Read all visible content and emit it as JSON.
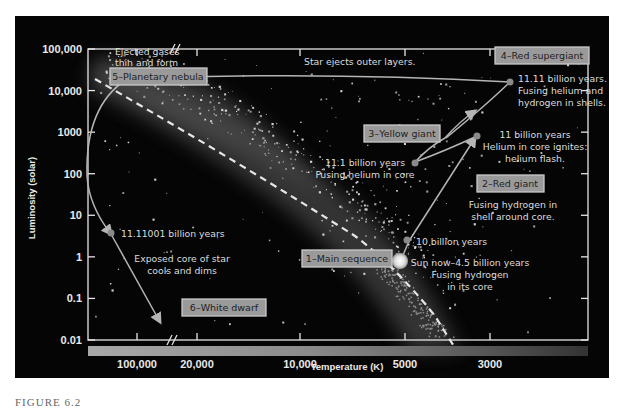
{
  "figure": {
    "caption": "FIGURE 6.2",
    "background_color": "#050505",
    "stage_box_color": "#9a9a9a",
    "track_color": "#b5b5b5"
  },
  "chart_data": {
    "type": "scatter",
    "title": "",
    "xlabel": "Temperature (K)",
    "ylabel": "Luminosity (solar)",
    "x_scale": "log, reversed (hot on left), axis break between 100,000 and 20,000",
    "y_scale": "log",
    "xlim": [
      150000,
      2500
    ],
    "ylim": [
      0.01,
      100000
    ],
    "x_ticks": [
      {
        "label": "100,000",
        "value": 100000
      },
      {
        "label": "20,000",
        "value": 20000
      },
      {
        "label": "10,000",
        "value": 10000
      },
      {
        "label": "5000",
        "value": 5000
      },
      {
        "label": "3000",
        "value": 3000
      }
    ],
    "y_ticks": [
      {
        "label": "100,000",
        "value": 100000
      },
      {
        "label": "10,000",
        "value": 10000
      },
      {
        "label": "1000",
        "value": 1000
      },
      {
        "label": "100",
        "value": 100
      },
      {
        "label": "10",
        "value": 10
      },
      {
        "label": "1",
        "value": 1
      },
      {
        "label": "0.1",
        "value": 0.1
      },
      {
        "label": "0.01",
        "value": 0.01
      }
    ],
    "grid": false,
    "legend": "none",
    "color_bar": "temperature gradient, light (hot, left) to dark (cool, right)",
    "stages": [
      {
        "id": 1,
        "label": "1–Main sequence",
        "notes": [
          "Sun now–4.5 billion years",
          "Fusing hydrogen",
          "in its core"
        ],
        "temperature": 5800,
        "luminosity": 1
      },
      {
        "id": 2,
        "label": "2–Red giant",
        "notes": [
          "Fusing hydrogen in",
          "shell around core."
        ],
        "temperature": 4500,
        "luminosity": 30
      },
      {
        "id": 3,
        "label": "3–Yellow giant",
        "notes": [
          "11.1 billion years",
          "Fusing helium in core"
        ],
        "temperature": 5000,
        "luminosity": 100
      },
      {
        "id": 4,
        "label": "4–Red supergiant",
        "notes": [
          "11.11 billion years.",
          "Fusing helium and",
          "hydrogen in shells."
        ],
        "temperature": 3300,
        "luminosity": 8000
      },
      {
        "id": 5,
        "label": "5–Planetary nebula",
        "notes": [
          "Ejected gases",
          "thin and form"
        ],
        "temperature": 100000,
        "luminosity": 4000
      },
      {
        "id": 6,
        "label": "6–White dwarf",
        "notes": [
          "Exposed core of star",
          "cools and dims"
        ],
        "temperature": 30000,
        "luminosity": 0.01
      }
    ],
    "track_points": [
      {
        "label": "Sun now–4.5 billion years",
        "temperature": 5800,
        "luminosity": 1
      },
      {
        "label": "10 billion years",
        "temperature": 5300,
        "luminosity": 1.8
      },
      {
        "label": "11 billion years",
        "temperature": 3700,
        "luminosity": 400
      },
      {
        "label": "11.1 billion years",
        "temperature": 5000,
        "luminosity": 100
      },
      {
        "label": "11.11 billion years",
        "temperature": 3300,
        "luminosity": 7500
      },
      {
        "label": "11.11001 billion years",
        "temperature": 100000,
        "luminosity": 2.5
      }
    ],
    "annotations": [
      "Star ejects outer layers.",
      "11 billion years",
      "Helium in core ignites:",
      "helium flash.",
      "10 billion years",
      "11.11001 billion years"
    ]
  }
}
